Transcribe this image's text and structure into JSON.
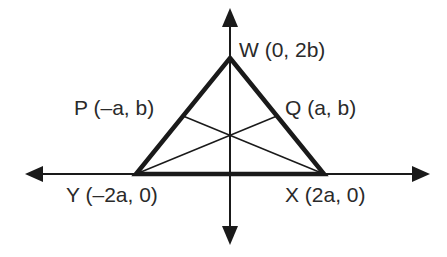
{
  "diagram": {
    "type": "coordinate-geometry",
    "colors": {
      "stroke": "#1a1a1a",
      "text": "#2a2a2a",
      "background": "#ffffff"
    },
    "axes": {
      "x_axis": "horizontal-double-arrow",
      "y_axis": "vertical-double-arrow"
    },
    "points": {
      "W": {
        "name": "W",
        "coords": "(0, 2b)",
        "label": "W (0, 2b)"
      },
      "P": {
        "name": "P",
        "coords": "(–a, b)",
        "label": "P (–a, b)"
      },
      "Q": {
        "name": "Q",
        "coords": "(a, b)",
        "label": "Q (a, b)"
      },
      "Y": {
        "name": "Y",
        "coords": "(–2a, 0)",
        "label": "Y (–2a, 0)"
      },
      "X": {
        "name": "X",
        "coords": "(2a, 0)",
        "label": "X (2a, 0)"
      }
    },
    "triangle": [
      "W",
      "X",
      "Y"
    ],
    "segments": [
      {
        "from": "P",
        "to": "X",
        "style": "thin"
      },
      {
        "from": "Q",
        "to": "Y",
        "style": "thin"
      }
    ]
  }
}
